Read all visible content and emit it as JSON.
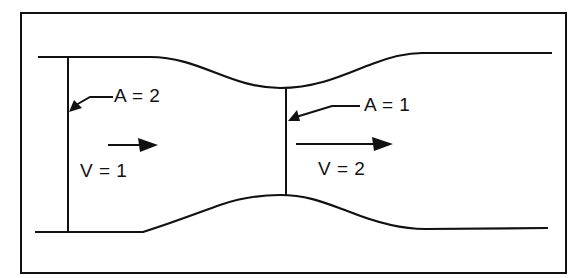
{
  "diagram": {
    "type": "venturi-tube-flow",
    "sections": [
      {
        "id": "wide",
        "area_label": "A = 2",
        "velocity_label": "V = 1"
      },
      {
        "id": "narrow",
        "area_label": "A = 1",
        "velocity_label": "V = 2"
      }
    ],
    "colors": {
      "stroke": "#111111",
      "background": "#ffffff"
    }
  }
}
